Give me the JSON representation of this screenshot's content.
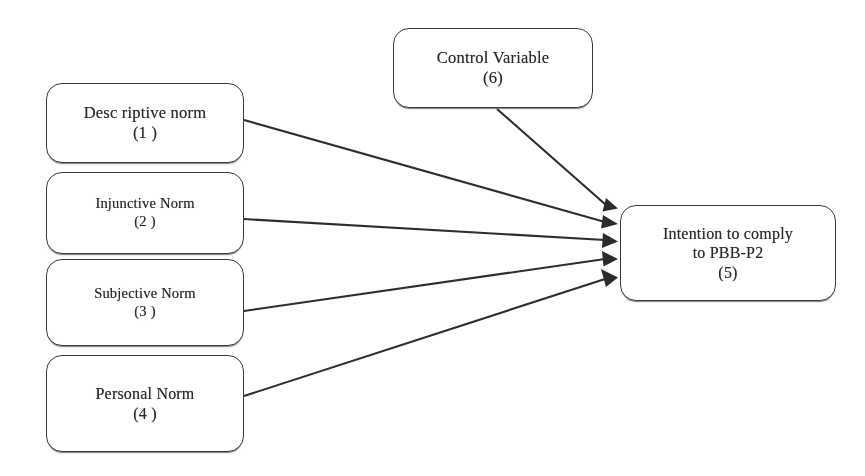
{
  "diagram": {
    "background_color": "#ffffff",
    "line_color": "#2e2e2e",
    "text_color": "#2a2a2a",
    "nodes": [
      {
        "id": "descriptive-norm",
        "label_line1": "Desc riptive norm",
        "label_line2": "(1 )",
        "number": "1"
      },
      {
        "id": "injunctive-norm",
        "label_line1": "Injunctive Norm",
        "label_line2": "(2 )",
        "number": "2"
      },
      {
        "id": "subjective-norm",
        "label_line1": "Subjective Norm",
        "label_line2": "(3 )",
        "number": "3"
      },
      {
        "id": "personal-norm",
        "label_line1": "Personal Norm",
        "label_line2": "(4 )",
        "number": "4"
      },
      {
        "id": "control-variable",
        "label_line1": "Control Variable",
        "label_line2": "(6)",
        "number": "6"
      },
      {
        "id": "intention",
        "label_line1": "Intention to comply",
        "label_line2": "to PBB-P2",
        "label_line3": "(5)",
        "number": "5"
      }
    ],
    "edges": [
      {
        "id": "edge-descriptive-to-intention",
        "from": "descriptive-norm",
        "to": "intention"
      },
      {
        "id": "edge-injunctive-to-intention",
        "from": "injunctive-norm",
        "to": "intention"
      },
      {
        "id": "edge-subjective-to-intention",
        "from": "subjective-norm",
        "to": "intention"
      },
      {
        "id": "edge-personal-to-intention",
        "from": "personal-norm",
        "to": "intention"
      },
      {
        "id": "edge-control-to-intention",
        "from": "control-variable",
        "to": "intention"
      }
    ]
  }
}
